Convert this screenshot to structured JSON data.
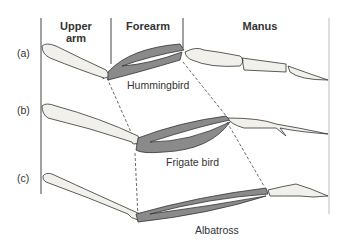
{
  "headers": {
    "upper_arm": "Upper arm",
    "forearm": "Forearm",
    "manus": "Manus"
  },
  "rows": [
    {
      "marker": "(a)",
      "species": "Hummingbird"
    },
    {
      "marker": "(b)",
      "species": "Frigate bird"
    },
    {
      "marker": "(c)",
      "species": "Albatross"
    }
  ],
  "colors": {
    "forearm_fill": "#8a8a8a",
    "bone_fill": "#f2f0ea",
    "outline": "#333333"
  }
}
